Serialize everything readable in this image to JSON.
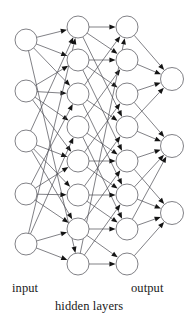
{
  "diagram": {
    "type": "neural-network-architecture",
    "background_color": "#ffffff",
    "stroke_color": "#4a4a52",
    "node_fill": "#ffffff",
    "arrow_color": "#141414",
    "node_radius": 11.0,
    "output_node_radius": 11.5,
    "stroke_width": 0.7,
    "labels": {
      "input": "input",
      "output": "output",
      "hidden": "hidden layers"
    },
    "layers": [
      {
        "id": "input",
        "name": "input",
        "kind": "input",
        "count": 5,
        "x": 26,
        "node_y": [
          40,
          91,
          141,
          194,
          244
        ]
      },
      {
        "id": "hidden1",
        "name": "hidden layer 1",
        "kind": "hidden",
        "count": 8,
        "x": 78,
        "node_y": [
          27,
          60,
          94,
          127,
          161,
          195,
          229,
          264
        ]
      },
      {
        "id": "hidden2",
        "name": "hidden layer 2",
        "kind": "hidden",
        "count": 8,
        "x": 127,
        "node_y": [
          27,
          60,
          94,
          127,
          161,
          195,
          229,
          264
        ]
      },
      {
        "id": "output",
        "name": "output",
        "kind": "output",
        "count": 3,
        "x": 172,
        "node_y": [
          79,
          146,
          213
        ]
      }
    ],
    "edges": [
      {
        "from": "input",
        "to": "hidden1",
        "pairs": [
          [
            0,
            0
          ],
          [
            0,
            1
          ],
          [
            0,
            2
          ],
          [
            0,
            7
          ],
          [
            1,
            1
          ],
          [
            1,
            2
          ],
          [
            1,
            3
          ],
          [
            1,
            4
          ],
          [
            2,
            0
          ],
          [
            2,
            4
          ],
          [
            2,
            5
          ],
          [
            2,
            6
          ],
          [
            3,
            2
          ],
          [
            3,
            4
          ],
          [
            3,
            5
          ],
          [
            3,
            6
          ],
          [
            4,
            0
          ],
          [
            4,
            3
          ],
          [
            4,
            6
          ],
          [
            4,
            7
          ]
        ]
      },
      {
        "from": "hidden1",
        "to": "hidden2",
        "pairs": [
          [
            0,
            0
          ],
          [
            0,
            1
          ],
          [
            0,
            3
          ],
          [
            1,
            1
          ],
          [
            1,
            2
          ],
          [
            1,
            4
          ],
          [
            2,
            0
          ],
          [
            2,
            3
          ],
          [
            2,
            5
          ],
          [
            3,
            1
          ],
          [
            3,
            4
          ],
          [
            3,
            6
          ],
          [
            4,
            2
          ],
          [
            4,
            4
          ],
          [
            4,
            5
          ],
          [
            5,
            3
          ],
          [
            5,
            5
          ],
          [
            5,
            6
          ],
          [
            6,
            4
          ],
          [
            6,
            6
          ],
          [
            6,
            7
          ],
          [
            7,
            0
          ],
          [
            7,
            5
          ],
          [
            7,
            7
          ]
        ]
      },
      {
        "from": "hidden2",
        "to": "output",
        "pairs": [
          [
            0,
            0
          ],
          [
            1,
            0
          ],
          [
            2,
            0
          ],
          [
            2,
            1
          ],
          [
            3,
            0
          ],
          [
            3,
            1
          ],
          [
            4,
            1
          ],
          [
            4,
            2
          ],
          [
            5,
            1
          ],
          [
            5,
            2
          ],
          [
            6,
            1
          ],
          [
            6,
            2
          ],
          [
            7,
            2
          ]
        ]
      }
    ]
  }
}
